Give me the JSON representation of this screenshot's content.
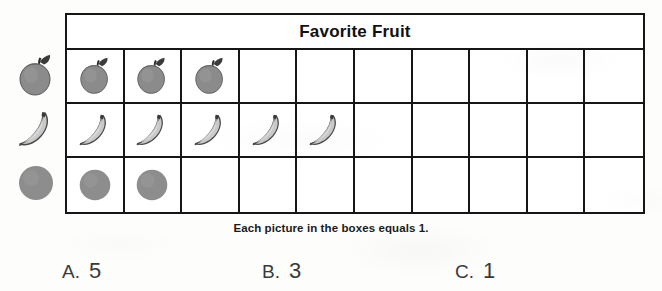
{
  "chart": {
    "title": "Favorite Fruit",
    "caption": "Each picture in the boxes equals 1.",
    "columns": 10
  },
  "chart_data": {
    "type": "bar",
    "title": "Favorite Fruit",
    "categories": [
      "Apple",
      "Banana",
      "Orange"
    ],
    "values": [
      3,
      5,
      2
    ],
    "icons": [
      "apple-icon",
      "banana-icon",
      "orange-icon"
    ],
    "xlabel": "",
    "ylabel": "",
    "xlim": [
      0,
      10
    ],
    "grid": true,
    "legend": false,
    "annotations": [
      "Each picture in the boxes equals 1."
    ],
    "note": "Horizontal pictograph; each picture in a box equals 1 unit. 10 boxes per row."
  },
  "options": [
    {
      "letter": "A.",
      "value": "5"
    },
    {
      "letter": "B.",
      "value": "3"
    },
    {
      "letter": "C.",
      "value": "1"
    }
  ]
}
